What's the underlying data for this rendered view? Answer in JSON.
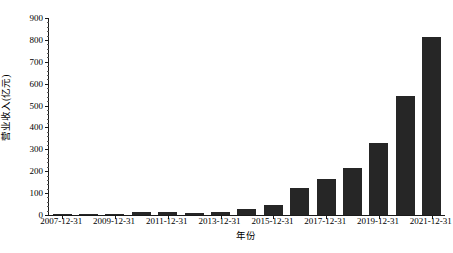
{
  "chart_data": {
    "type": "bar",
    "title": "",
    "subtitle": "",
    "xlabel": "年份",
    "ylabel": "营业收入(亿元)",
    "categories": [
      "2007-12-31",
      "2008-12-31",
      "2009-12-31",
      "2010-12-31",
      "2011-12-31",
      "2012-12-31",
      "2013-12-31",
      "2014-12-31",
      "2015-12-31",
      "2016-12-31",
      "2017-12-31",
      "2018-12-31",
      "2019-12-31",
      "2020-12-31",
      "2021-12-31"
    ],
    "values": [
      2,
      2,
      3,
      12,
      13,
      11,
      16,
      27,
      48,
      122,
      166,
      215,
      327,
      544,
      812
    ],
    "series": [
      {
        "name": "营业收入(亿元)",
        "values": [
          2,
          2,
          3,
          12,
          13,
          11,
          16,
          27,
          48,
          122,
          166,
          215,
          327,
          544,
          812
        ]
      }
    ],
    "ylim": [
      0,
      900
    ],
    "yticks": [
      0,
      100,
      200,
      300,
      400,
      500,
      600,
      700,
      800,
      900
    ],
    "ytick_labels": [
      "0",
      "100",
      "200",
      "300",
      "400",
      "500",
      "600",
      "700",
      "800",
      "900"
    ],
    "xtick_labels": [
      "2007-12-31",
      "2009-12-31",
      "2011-12-31",
      "2013-12-31",
      "2015-12-31",
      "2017-12-31",
      "2019-12-31",
      "2021-12-31"
    ],
    "xtick_indices": [
      0,
      2,
      4,
      6,
      8,
      10,
      12,
      14
    ],
    "minor_ytick_step": 20,
    "grid": false,
    "legend": false,
    "legend_position": "none",
    "bar_color": "#262626",
    "axis_color": "#1a1a1a",
    "background_color": "#ffffff",
    "bar_width_ratio": 0.72
  }
}
